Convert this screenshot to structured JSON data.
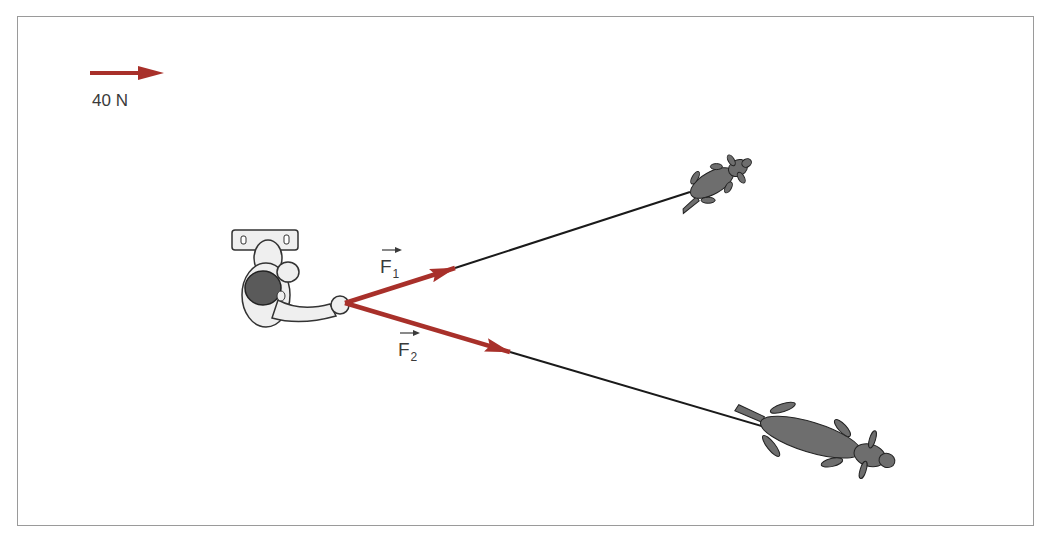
{
  "diagram": {
    "type": "force-vector-diagram",
    "scale": {
      "label": "40 N",
      "arrow_length_px": 74
    },
    "forces": [
      {
        "name": "F1",
        "symbol": "F",
        "subscript": "1",
        "direction": "up-right, toward upper dog"
      },
      {
        "name": "F2",
        "symbol": "F",
        "subscript": "2",
        "direction": "down-right, toward lower dog"
      }
    ],
    "figures": [
      {
        "name": "person",
        "description": "person seen from above, holding leashes"
      },
      {
        "name": "dog-upper",
        "description": "smaller dog pulling up-right"
      },
      {
        "name": "dog-lower",
        "description": "larger dog pulling down-right"
      }
    ],
    "colors": {
      "vector": "#a8302a",
      "leash": "#1a1a1a",
      "dog_fill": "#6e6e6e",
      "person_fill": "#efefef",
      "frame": "#9a9a9a",
      "text": "#3a3a3a"
    }
  }
}
